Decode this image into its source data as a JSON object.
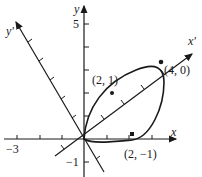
{
  "axes": {
    "x_label": "x",
    "y_label": "y",
    "xp_label": "x'",
    "yp_label": "y'"
  },
  "ticks": {
    "x_neg3": "−3",
    "y_5": "5",
    "y_neg1": "−1"
  },
  "points": {
    "p1": "(2, 1)",
    "p2": "(4, 0)",
    "p3": "(2, −1)"
  },
  "colors": {
    "ink": "#1a1a1a"
  }
}
